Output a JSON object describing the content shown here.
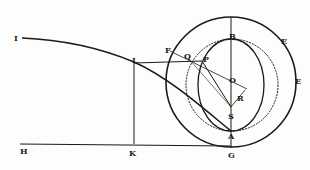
{
  "diagram": {
    "type": "geometric-figure",
    "colors": {
      "ink": "#1a1a1a",
      "paper": "#fdfdfc"
    },
    "labels": {
      "I": "I",
      "L": "L",
      "H": "H",
      "K": "K",
      "F": "F",
      "Q": "Q",
      "P": "P",
      "B": "B",
      "E1": "E",
      "E2": "E",
      "O": "O",
      "R": "R",
      "S": "S",
      "A": "A",
      "G": "G"
    }
  }
}
